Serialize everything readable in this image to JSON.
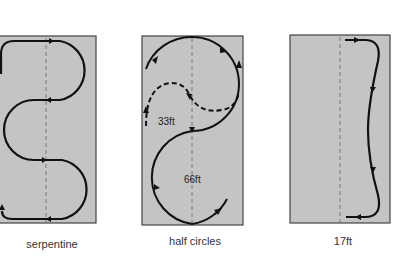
{
  "diagrams": [
    {
      "id": "serpentine",
      "caption": "serpentine",
      "pattern": "S-curve serpentine with two loops along a dashed centerline"
    },
    {
      "id": "half-circles",
      "caption": "half circles",
      "pattern": "Two stacked half circles; dashed smaller variant above",
      "labels": {
        "small_radius": "33ft",
        "large_radius": "66ft"
      }
    },
    {
      "id": "seventeen-ft",
      "caption": "17ft",
      "pattern": "Shallow curved lane along right side of box"
    }
  ],
  "colors": {
    "box_fill": "#c4c4c4",
    "box_border": "#444444",
    "path_stroke": "#111111",
    "centerline": "#666666",
    "background": "#ffffff"
  }
}
